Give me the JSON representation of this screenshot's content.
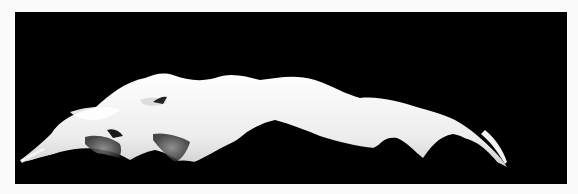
{
  "image": {
    "subject": "abstract white calla lily form on black background",
    "border_color": "#fafafa",
    "background_color": "#000000",
    "subject_color": "#f2f2f2",
    "shadow_color": "#6a6a6a"
  }
}
